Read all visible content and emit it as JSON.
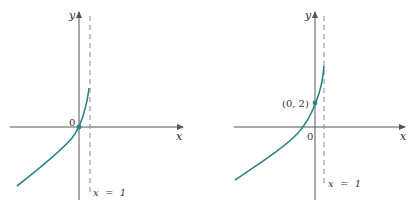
{
  "colors": {
    "curve": "#2a8585",
    "axis": "#555555",
    "dash": "#888888",
    "text": "#333333"
  },
  "graphs": [
    {
      "id": "left",
      "axis_labels": {
        "x": "x",
        "y": "y"
      },
      "origin_label": "0",
      "asymptote_label": "x  =  1",
      "point_label": ""
    },
    {
      "id": "right",
      "axis_labels": {
        "x": "x",
        "y": "y"
      },
      "origin_label": "0",
      "asymptote_label": "x  =  1",
      "point_label": "(0, 2)"
    }
  ]
}
